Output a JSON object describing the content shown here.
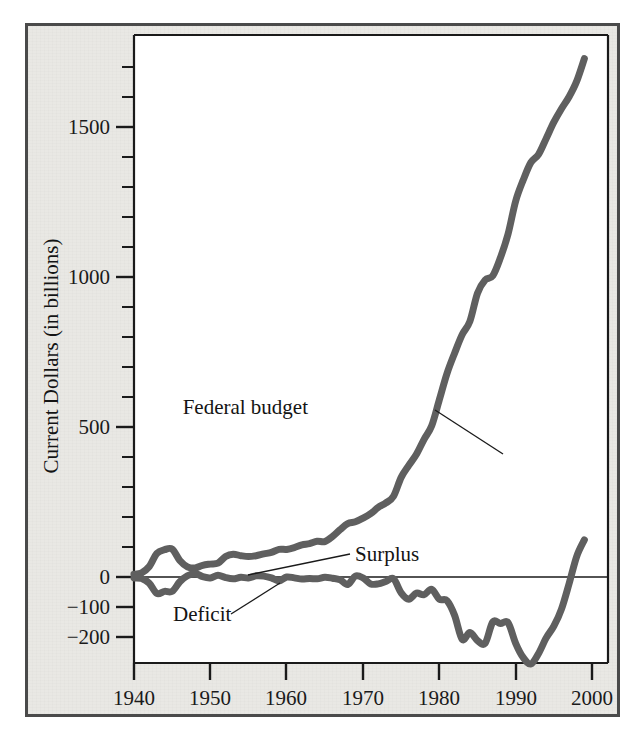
{
  "figure": {
    "background_color": "#e9e8e4",
    "border_color": "#4a4a4a",
    "plot_background": "#ffffff",
    "line_color": "#5a5a5a",
    "axis_color": "#1a1a1a"
  },
  "chart_data": {
    "type": "line",
    "title": "",
    "xlabel": "",
    "ylabel": "Current Dollars (in billions)",
    "xlim": [
      1940,
      2001
    ],
    "ylim": [
      -260,
      1800
    ],
    "grid": false,
    "legend": "annotations-on-plot",
    "x_ticks": [
      "1940",
      "1950",
      "1960",
      "1970",
      "1980",
      "1990",
      "2000"
    ],
    "x_tick_values": [
      1940,
      1950,
      1960,
      1970,
      1980,
      1990,
      2000
    ],
    "x_note": "(est.)",
    "y_ticks": [
      "1500",
      "1000",
      "500",
      "0",
      "−100",
      "−200"
    ],
    "y_tick_values": [
      1500,
      1000,
      500,
      0,
      -100,
      -200
    ],
    "y_minor_step": 100,
    "annotations": [
      {
        "name": "federal-budget",
        "text": "Federal budget",
        "x": 305,
        "y": 411,
        "leader": [
          [
            432,
            408
          ],
          [
            500,
            452
          ]
        ]
      },
      {
        "name": "surplus",
        "text": "Surplus",
        "x": 352,
        "y": 557,
        "leader": [
          [
            347,
            552
          ],
          [
            245,
            573
          ]
        ]
      },
      {
        "name": "deficit",
        "text": "Deficit",
        "x": 170,
        "y": 617,
        "leader": [
          [
            228,
            611
          ],
          [
            277,
            580
          ]
        ]
      }
    ],
    "series": [
      {
        "name": "Federal budget",
        "x": [
          1940,
          1941,
          1942,
          1943,
          1944,
          1945,
          1946,
          1947,
          1948,
          1949,
          1950,
          1951,
          1952,
          1953,
          1954,
          1955,
          1956,
          1957,
          1958,
          1959,
          1960,
          1961,
          1962,
          1963,
          1964,
          1965,
          1966,
          1967,
          1968,
          1969,
          1970,
          1971,
          1972,
          1973,
          1974,
          1975,
          1976,
          1977,
          1978,
          1979,
          1980,
          1981,
          1982,
          1983,
          1984,
          1985,
          1986,
          1987,
          1988,
          1989,
          1990,
          1991,
          1992,
          1993,
          1994,
          1995,
          1996,
          1997,
          1998,
          1999
        ],
        "values": [
          9,
          14,
          35,
          79,
          91,
          93,
          55,
          34,
          30,
          39,
          43,
          46,
          68,
          76,
          71,
          68,
          71,
          77,
          82,
          92,
          92,
          98,
          107,
          111,
          119,
          118,
          135,
          158,
          178,
          184,
          196,
          211,
          232,
          247,
          269,
          332,
          372,
          409,
          459,
          504,
          591,
          678,
          746,
          808,
          852,
          946,
          990,
          1004,
          1064,
          1143,
          1253,
          1324,
          1382,
          1409,
          1462,
          1516,
          1561,
          1601,
          1653,
          1728
        ],
        "units": "billions of current dollars"
      },
      {
        "name": "Surplus/Deficit",
        "x": [
          1940,
          1941,
          1942,
          1943,
          1944,
          1945,
          1946,
          1947,
          1948,
          1949,
          1950,
          1951,
          1952,
          1953,
          1954,
          1955,
          1956,
          1957,
          1958,
          1959,
          1960,
          1961,
          1962,
          1963,
          1964,
          1965,
          1966,
          1967,
          1968,
          1969,
          1970,
          1971,
          1972,
          1973,
          1974,
          1975,
          1976,
          1977,
          1978,
          1979,
          1980,
          1981,
          1982,
          1983,
          1984,
          1985,
          1986,
          1987,
          1988,
          1989,
          1990,
          1991,
          1992,
          1993,
          1994,
          1995,
          1996,
          1997,
          1998,
          1999
        ],
        "values": [
          -3,
          -5,
          -21,
          -55,
          -48,
          -48,
          -16,
          4,
          12,
          1,
          -3,
          6,
          -2,
          -6,
          -1,
          -3,
          4,
          3,
          -3,
          -13,
          0,
          -3,
          -7,
          -5,
          -6,
          -1,
          -4,
          -9,
          -25,
          3,
          -3,
          -23,
          -23,
          -15,
          -6,
          -53,
          -74,
          -54,
          -59,
          -41,
          -74,
          -79,
          -128,
          -208,
          -185,
          -212,
          -221,
          -150,
          -155,
          -152,
          -221,
          -269,
          -290,
          -255,
          -203,
          -164,
          -107,
          -22,
          69,
          124
        ],
        "units": "billions of current dollars"
      }
    ]
  }
}
